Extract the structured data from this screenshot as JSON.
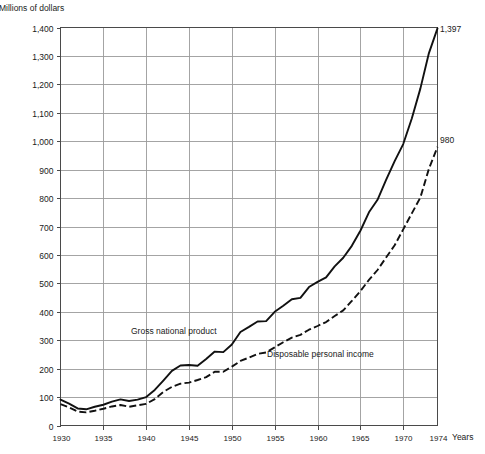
{
  "chart_data": {
    "type": "line",
    "title": "",
    "ylabel": "Millions of dollars",
    "xlabel": "Years",
    "xlim": [
      1930,
      1974
    ],
    "ylim": [
      0,
      1400
    ],
    "grid": true,
    "legend_position": "inline-annotations",
    "y_ticks": [
      "0",
      "100",
      "200",
      "300",
      "400",
      "500",
      "600",
      "700",
      "800",
      "900",
      "1,000",
      "1,100",
      "1,200",
      "1,300",
      "1,400"
    ],
    "y_tick_values": [
      0,
      100,
      200,
      300,
      400,
      500,
      600,
      700,
      800,
      900,
      1000,
      1100,
      1200,
      1300,
      1400
    ],
    "x_ticks": [
      "1930",
      "1935",
      "1940",
      "1945",
      "1950",
      "1955",
      "1960",
      "1965",
      "1970",
      "1974"
    ],
    "x_tick_values": [
      1930,
      1935,
      1940,
      1945,
      1950,
      1955,
      1960,
      1965,
      1970,
      1974
    ],
    "x": [
      1930,
      1931,
      1932,
      1933,
      1934,
      1935,
      1936,
      1937,
      1938,
      1939,
      1940,
      1941,
      1942,
      1943,
      1944,
      1945,
      1946,
      1947,
      1948,
      1949,
      1950,
      1951,
      1952,
      1953,
      1954,
      1955,
      1956,
      1957,
      1958,
      1959,
      1960,
      1961,
      1962,
      1963,
      1964,
      1965,
      1966,
      1967,
      1968,
      1969,
      1970,
      1971,
      1972,
      1973,
      1974
    ],
    "series": [
      {
        "name": "Gross national product",
        "style": "solid",
        "label": "Gross national product",
        "end_value_label": "1,397",
        "values": [
          91,
          77,
          60,
          57,
          66,
          73,
          84,
          92,
          86,
          91,
          100,
          125,
          158,
          192,
          211,
          213,
          210,
          234,
          260,
          258,
          285,
          329,
          347,
          366,
          367,
          400,
          421,
          444,
          449,
          487,
          505,
          521,
          560,
          590,
          632,
          685,
          750,
          794,
          864,
          930,
          990,
          1080,
          1185,
          1310,
          1397
        ]
      },
      {
        "name": "Disposable personal income",
        "style": "dashed",
        "label": "Disposable personal income",
        "end_value_label": "980",
        "values": [
          75,
          64,
          49,
          46,
          52,
          59,
          67,
          72,
          66,
          71,
          76,
          93,
          118,
          136,
          147,
          151,
          160,
          170,
          189,
          189,
          207,
          227,
          239,
          252,
          257,
          275,
          293,
          309,
          319,
          337,
          350,
          364,
          385,
          405,
          438,
          473,
          512,
          547,
          591,
          634,
          690,
          746,
          802,
          903,
          980
        ]
      }
    ],
    "annotations": [
      {
        "text": "1,397",
        "series": "Gross national product",
        "position": "end"
      },
      {
        "text": "980",
        "series": "Disposable personal income",
        "position": "end"
      }
    ]
  }
}
